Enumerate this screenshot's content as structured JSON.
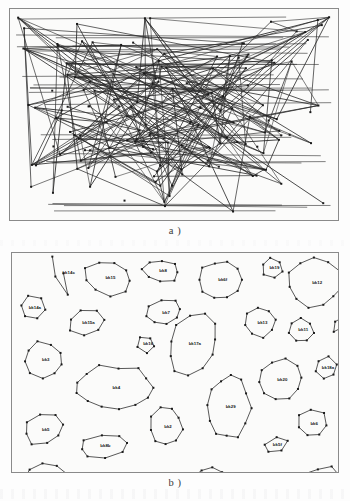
{
  "figure": {
    "panels": [
      {
        "id": "a",
        "caption": "a )",
        "description": "tangled graph drawing with many edge crossings",
        "node_count": 148,
        "edge_count": 214
      },
      {
        "id": "b",
        "caption": "b )",
        "description": "untangled graph drawing, clusters separated into polygons",
        "cluster_count": 34
      }
    ]
  },
  "colors": {
    "ink": "#1a1a1a",
    "edge": "#2a2a2a",
    "panel_border": "#8a8a8a",
    "panel_background": "#fbfbfa",
    "page_background": "#fdfdfd",
    "caption_text": "#3a3a3a"
  },
  "chart_data": {
    "type": "scatter",
    "title": "",
    "subtitle": "",
    "xlabel": "",
    "ylabel": "",
    "grid": false,
    "legend": "none",
    "panel_a": {
      "type": "graph",
      "layout": "random / tangled",
      "nodes": 148,
      "edges": 214,
      "node_marker": "filled square",
      "xlim": [
        0,
        330
      ],
      "ylim": [
        0,
        213
      ]
    },
    "panel_b": {
      "type": "graph",
      "layout": "clustered / untangled polygons",
      "node_marker": "filled square",
      "xlim": [
        0,
        328
      ],
      "ylim": [
        0,
        221
      ],
      "clusters": [
        {
          "label": "bk14c",
          "cx": 48,
          "cy": 22,
          "rx": 13,
          "ry": 22,
          "n": 4,
          "rot": -22,
          "squash": 0.22
        },
        {
          "label": "bk14a",
          "cx": 21,
          "cy": 55,
          "rx": 13,
          "ry": 12,
          "n": 6,
          "rot": 10,
          "squash": 1
        },
        {
          "label": "bk15",
          "cx": 97,
          "cy": 25,
          "rx": 24,
          "ry": 17,
          "n": 9,
          "rot": 8,
          "squash": 1
        },
        {
          "label": "bk15a",
          "cx": 75,
          "cy": 70,
          "rx": 19,
          "ry": 13,
          "n": 7,
          "rot": -8,
          "squash": 1
        },
        {
          "label": "bk8",
          "cx": 150,
          "cy": 18,
          "rx": 18,
          "ry": 11,
          "n": 8,
          "rot": 5,
          "squash": 1
        },
        {
          "label": "bk7",
          "cx": 153,
          "cy": 60,
          "rx": 18,
          "ry": 12,
          "n": 8,
          "rot": -12,
          "squash": 1
        },
        {
          "label": "bk16",
          "cx": 135,
          "cy": 92,
          "rx": 9,
          "ry": 8,
          "n": 5,
          "rot": 15,
          "squash": 1
        },
        {
          "label": "bk6f",
          "cx": 210,
          "cy": 27,
          "rx": 21,
          "ry": 19,
          "n": 10,
          "rot": 0,
          "squash": 1
        },
        {
          "label": "bk19",
          "cx": 262,
          "cy": 15,
          "rx": 11,
          "ry": 10,
          "n": 6,
          "rot": 20,
          "squash": 1
        },
        {
          "label": "bk12",
          "cx": 305,
          "cy": 30,
          "rx": 26,
          "ry": 24,
          "n": 11,
          "rot": 6,
          "squash": 1
        },
        {
          "label": "bk13",
          "cx": 250,
          "cy": 70,
          "rx": 16,
          "ry": 15,
          "n": 8,
          "rot": -10,
          "squash": 1
        },
        {
          "label": "bk11",
          "cx": 291,
          "cy": 78,
          "rx": 13,
          "ry": 12,
          "n": 7,
          "rot": 12,
          "squash": 1
        },
        {
          "label": "bk61k",
          "cx": 329,
          "cy": 72,
          "rx": 7,
          "ry": 9,
          "n": 4,
          "rot": 35,
          "squash": 0.4
        },
        {
          "label": "bk17a",
          "cx": 182,
          "cy": 92,
          "rx": 23,
          "ry": 30,
          "n": 11,
          "rot": 28,
          "squash": 1
        },
        {
          "label": "bk3",
          "cx": 32,
          "cy": 108,
          "rx": 20,
          "ry": 18,
          "n": 9,
          "rot": 14,
          "squash": 1
        },
        {
          "label": "bk18a",
          "cx": 316,
          "cy": 116,
          "rx": 11,
          "ry": 11,
          "n": 6,
          "rot": -18,
          "squash": 1
        },
        {
          "label": "bk4",
          "cx": 103,
          "cy": 136,
          "rx": 39,
          "ry": 22,
          "n": 13,
          "rot": 0,
          "squash": 1
        },
        {
          "label": "bk20",
          "cx": 270,
          "cy": 128,
          "rx": 22,
          "ry": 20,
          "n": 10,
          "rot": -6,
          "squash": 1
        },
        {
          "label": "bk29",
          "cx": 218,
          "cy": 155,
          "rx": 21,
          "ry": 32,
          "n": 12,
          "rot": 4,
          "squash": 1
        },
        {
          "label": "bk5",
          "cx": 32,
          "cy": 178,
          "rx": 20,
          "ry": 15,
          "n": 8,
          "rot": -14,
          "squash": 1
        },
        {
          "label": "bk2",
          "cx": 155,
          "cy": 175,
          "rx": 16,
          "ry": 19,
          "n": 9,
          "rot": 10,
          "squash": 1
        },
        {
          "label": "bk6",
          "cx": 302,
          "cy": 172,
          "rx": 15,
          "ry": 14,
          "n": 7,
          "rot": 8,
          "squash": 1
        },
        {
          "label": "bk5f",
          "cx": 265,
          "cy": 194,
          "rx": 12,
          "ry": 7,
          "n": 5,
          "rot": -20,
          "squash": 1
        },
        {
          "label": "bk8b",
          "cx": 92,
          "cy": 195,
          "rx": 24,
          "ry": 11,
          "n": 8,
          "rot": -8,
          "squash": 1
        },
        {
          "label": "bk1",
          "cx": 36,
          "cy": 233,
          "rx": 23,
          "ry": 20,
          "n": 10,
          "rot": 6,
          "squash": 1
        },
        {
          "label": "bk9a",
          "cx": 93,
          "cy": 247,
          "rx": 18,
          "ry": 11,
          "n": 6,
          "rot": -10,
          "squash": 1
        },
        {
          "label": "bk10c",
          "cx": 148,
          "cy": 245,
          "rx": 15,
          "ry": 9,
          "n": 6,
          "rot": 12,
          "squash": 1
        },
        {
          "label": "bk7b",
          "cx": 200,
          "cy": 232,
          "rx": 18,
          "ry": 17,
          "n": 9,
          "rot": -5,
          "squash": 1
        },
        {
          "label": "bk9d",
          "cx": 238,
          "cy": 238,
          "rx": 5,
          "ry": 14,
          "n": 3,
          "rot": 12,
          "squash": 0.25
        },
        {
          "label": "bk9b",
          "cx": 272,
          "cy": 248,
          "rx": 12,
          "ry": 8,
          "n": 5,
          "rot": 18,
          "squash": 1
        },
        {
          "label": "bk18b",
          "cx": 313,
          "cy": 236,
          "rx": 22,
          "ry": 20,
          "n": 10,
          "rot": 3,
          "squash": 1
        }
      ]
    }
  }
}
